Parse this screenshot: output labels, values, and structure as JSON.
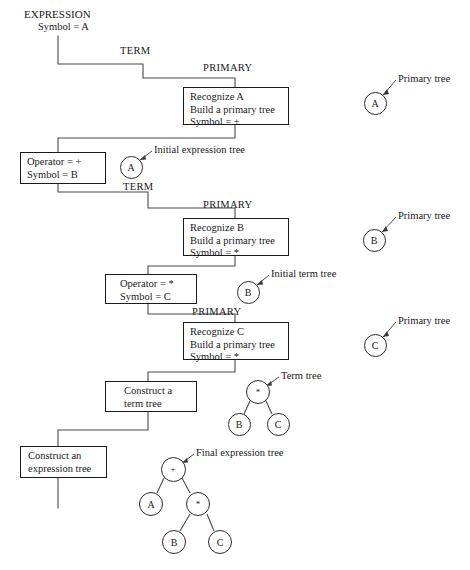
{
  "diagram": {
    "title_block": {
      "heading": "EXPRESSION",
      "subline": "Symbol = A"
    },
    "nonterminals": [
      {
        "id": "term-1",
        "label": "TERM",
        "x": 120,
        "y": 45
      },
      {
        "id": "primary-1",
        "label": "PRIMARY",
        "x": 203,
        "y": 62
      },
      {
        "id": "term-2",
        "label": "TERM",
        "x": 123,
        "y": 181
      },
      {
        "id": "primary-2",
        "label": "PRIMARY",
        "x": 203,
        "y": 199
      },
      {
        "id": "primary-3",
        "label": "PRIMARY",
        "x": 192,
        "y": 306
      }
    ],
    "process_boxes": [
      {
        "id": "recognize-a",
        "lines": [
          "Recognize A",
          "Build a primary tree",
          "Symbol = +"
        ],
        "x": 183,
        "y": 87,
        "w": 106,
        "h": 38
      },
      {
        "id": "operator-plus",
        "lines": [
          "Operator = +",
          "Symbol = B"
        ],
        "x": 20,
        "y": 152,
        "w": 86,
        "h": 32
      },
      {
        "id": "recognize-b",
        "lines": [
          "Recognize B",
          "Build a primary tree",
          "Symbol = *"
        ],
        "x": 183,
        "y": 218,
        "w": 106,
        "h": 38
      },
      {
        "id": "operator-star",
        "lines": [
          "Operator = *",
          "Symbol = C"
        ],
        "x": 105,
        "y": 274,
        "w": 92,
        "h": 30
      },
      {
        "id": "recognize-c",
        "lines": [
          "Recognize C",
          "Build a primary tree",
          "Symbol = *"
        ],
        "x": 183,
        "y": 322,
        "w": 106,
        "h": 38
      },
      {
        "id": "construct-term-tree",
        "lines": [
          "Construct a",
          "term tree"
        ],
        "x": 105,
        "y": 381,
        "w": 92,
        "h": 31
      },
      {
        "id": "construct-expression-tree",
        "lines": [
          "Construct an",
          "expression tree"
        ],
        "x": 20,
        "y": 446,
        "w": 87,
        "h": 32
      }
    ],
    "nodes": [
      {
        "id": "primary-tree-a",
        "label": "A",
        "cx": 375,
        "cy": 103,
        "r": 11.5
      },
      {
        "id": "initial-expression-tree-a",
        "label": "A",
        "cx": 131,
        "cy": 167,
        "r": 11.5
      },
      {
        "id": "primary-tree-b",
        "label": "B",
        "cx": 374,
        "cy": 240,
        "r": 11.5
      },
      {
        "id": "initial-term-tree-b",
        "label": "B",
        "cx": 248,
        "cy": 292,
        "r": 11.5
      },
      {
        "id": "primary-tree-c",
        "label": "C",
        "cx": 375,
        "cy": 345,
        "r": 11.5
      },
      {
        "id": "term-tree-root",
        "label": "*",
        "cx": 258,
        "cy": 392,
        "r": 12
      },
      {
        "id": "term-tree-left",
        "label": "B",
        "cx": 239,
        "cy": 424,
        "r": 11.5
      },
      {
        "id": "term-tree-right",
        "label": "C",
        "cx": 278,
        "cy": 424,
        "r": 11.5
      },
      {
        "id": "final-tree-root",
        "label": "+",
        "cx": 173,
        "cy": 469,
        "r": 12.5
      },
      {
        "id": "final-tree-a",
        "label": "A",
        "cx": 151,
        "cy": 504,
        "r": 12
      },
      {
        "id": "final-tree-star",
        "label": "*",
        "cx": 198,
        "cy": 504,
        "r": 12
      },
      {
        "id": "final-tree-b",
        "label": "B",
        "cx": 174,
        "cy": 542,
        "r": 12
      },
      {
        "id": "final-tree-c",
        "label": "C",
        "cx": 220,
        "cy": 542,
        "r": 12
      }
    ],
    "callouts": [
      {
        "id": "callout-primary-tree-a",
        "text": "Primary tree",
        "x": 398,
        "y": 78
      },
      {
        "id": "callout-initial-expression",
        "text": "Initial expression tree",
        "x": 154,
        "y": 148
      },
      {
        "id": "callout-primary-tree-b",
        "text": "Primary tree",
        "x": 398,
        "y": 215
      },
      {
        "id": "callout-initial-term-tree",
        "text": "Initial term tree",
        "x": 271,
        "y": 272
      },
      {
        "id": "callout-primary-tree-c",
        "text": "Primary tree",
        "x": 398,
        "y": 320
      },
      {
        "id": "callout-term-tree",
        "text": "Term tree",
        "x": 281,
        "y": 375
      },
      {
        "id": "callout-final-expression-tree",
        "text": "Final expression tree",
        "x": 196,
        "y": 452
      }
    ],
    "colors": {
      "ink": "#1a1a1a",
      "wire": "#4a4a4a",
      "box_border": "#1a1a1a",
      "node_border": "#2b2b2b",
      "background": "#ffffff"
    }
  }
}
